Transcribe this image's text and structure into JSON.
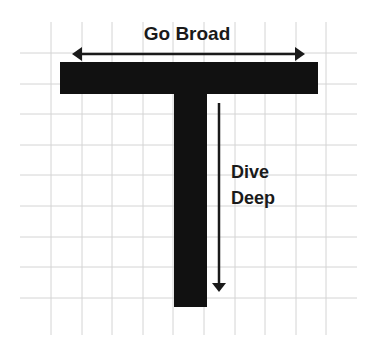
{
  "diagram": {
    "labels": {
      "horizontal": "Go Broad",
      "vertical_line1": "Dive",
      "vertical_line2": "Deep"
    },
    "colors": {
      "background": "#ffffff",
      "grid": "#d4d4d4",
      "shape": "#111111",
      "arrow": "#1a1a1a",
      "text": "#1a1a1a"
    },
    "grid": {
      "vertical_x": [
        51,
        82,
        112,
        143,
        173,
        204,
        235,
        265,
        296,
        326
      ],
      "horizontal_y": [
        53,
        84,
        114,
        145,
        175,
        206,
        237,
        267,
        298
      ]
    }
  }
}
